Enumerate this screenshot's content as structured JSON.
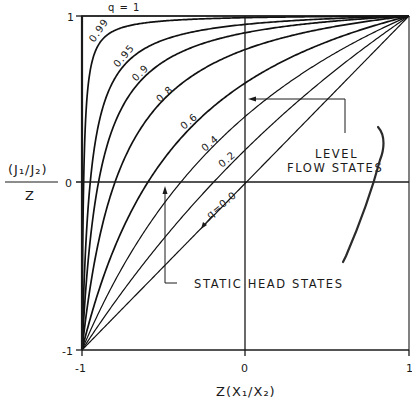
{
  "chart_data": {
    "type": "line",
    "title": "",
    "xlabel": "Z(X1/X2)",
    "ylabel": "(J1/J2) / Z",
    "ylabel_numerator": "(J₁/J₂)",
    "ylabel_denominator": "Z",
    "xlabel_display": "Z(X₁/X₂)",
    "xlim": [
      -1,
      1
    ],
    "ylim": [
      -1,
      1
    ],
    "grid": false,
    "x_ticks": [
      {
        "value": -1,
        "label": "-1"
      },
      {
        "value": 0,
        "label": "0"
      },
      {
        "value": 1,
        "label": "1"
      }
    ],
    "y_ticks": [
      {
        "value": -1,
        "label": "-1"
      },
      {
        "value": 0,
        "label": "0"
      },
      {
        "value": 1,
        "label": "1"
      }
    ],
    "relation": "y = (x + q) / (1 + q x)",
    "series": [
      {
        "name": "q = 1",
        "q": 1.0,
        "label": "q = 1",
        "x_zero_crossing": -1.0,
        "y_at_x0": 1.0
      },
      {
        "name": "0.99",
        "q": 0.99,
        "label": "0.99",
        "x_zero_crossing": -0.99,
        "y_at_x0": 0.99
      },
      {
        "name": "0.95",
        "q": 0.95,
        "label": "0.95",
        "x_zero_crossing": -0.95,
        "y_at_x0": 0.95
      },
      {
        "name": "0.9",
        "q": 0.9,
        "label": "0.9",
        "x_zero_crossing": -0.9,
        "y_at_x0": 0.9
      },
      {
        "name": "0.8",
        "q": 0.8,
        "label": "0.8",
        "x_zero_crossing": -0.8,
        "y_at_x0": 0.8
      },
      {
        "name": "0.6",
        "q": 0.6,
        "label": "0.6",
        "x_zero_crossing": -0.6,
        "y_at_x0": 0.6
      },
      {
        "name": "0.4",
        "q": 0.4,
        "label": "0.4",
        "x_zero_crossing": -0.4,
        "y_at_x0": 0.4
      },
      {
        "name": "0.2",
        "q": 0.2,
        "label": "0.2",
        "x_zero_crossing": -0.2,
        "y_at_x0": 0.2
      },
      {
        "name": "q = 0.0",
        "q": 0.0,
        "label": "q=0.0",
        "x_zero_crossing": 0.0,
        "y_at_x0": 0.0
      }
    ],
    "annotations": [
      {
        "text_lines": [
          "LEVEL",
          "FLOW STATES"
        ],
        "arrow_target": "x = 0 axis (y ≈ 0.5)"
      },
      {
        "text_lines": [
          "STATIC HEAD STATES"
        ],
        "arrow_target": "y = 0 axis (x ≈ -0.5)"
      }
    ]
  },
  "labels": {
    "top_curve": "q = 1",
    "c099": "0.99",
    "c095": "0.95",
    "c09": "0.9",
    "c08": "0.8",
    "c06": "0.6",
    "c04": "0.4",
    "c02": "0.2",
    "c00": "q=0.0",
    "level": "LEVEL",
    "flow_states": "FLOW STATES",
    "static_head": "STATIC HEAD STATES",
    "y_num": "(J₁/J₂)",
    "y_den": "Z",
    "x_title": "Z(X₁/X₂)",
    "y_tick_top": "1",
    "y_tick_mid": "0",
    "y_tick_bot": "-1",
    "x_tick_left": "-1",
    "x_tick_mid": "0",
    "x_tick_right": "1"
  }
}
